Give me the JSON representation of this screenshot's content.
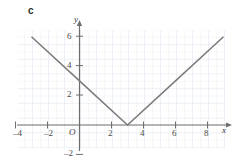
{
  "part_label": "c",
  "colors": {
    "grid": "#dfe6ef",
    "axis": "#6e6e6e",
    "curve": "#7a7a7a",
    "text": "#3a3a3a",
    "background": "#ffffff"
  },
  "axes": {
    "x_axis_label": "x",
    "y_axis_label": "y",
    "origin_label": "O",
    "x_ticks": [
      {
        "value": -4,
        "label": "–4"
      },
      {
        "value": -2,
        "label": "–2"
      },
      {
        "value": 2,
        "label": "2"
      },
      {
        "value": 4,
        "label": "4"
      },
      {
        "value": 6,
        "label": "6"
      },
      {
        "value": 8,
        "label": "8"
      }
    ],
    "y_ticks": [
      {
        "value": 6,
        "label": "6"
      },
      {
        "value": 4,
        "label": "4"
      },
      {
        "value": 2,
        "label": "2"
      },
      {
        "value": -2,
        "label": "–2"
      }
    ]
  },
  "chart_data": {
    "type": "line",
    "title": "",
    "subtitle": "",
    "xlabel": "x",
    "ylabel": "y",
    "xlim": [
      -4.2,
      9.5
    ],
    "ylim": [
      -2.5,
      7
    ],
    "grid": true,
    "legend": null,
    "x_ticks": [
      -4,
      -2,
      0,
      2,
      4,
      6,
      8
    ],
    "y_ticks": [
      -2,
      0,
      2,
      4,
      6
    ],
    "equation": "y = |x - 3|",
    "vertex": [
      3,
      0
    ],
    "y_intercept": 3,
    "series": [
      {
        "name": "y = |x - 3|",
        "points": [
          [
            -3,
            6
          ],
          [
            0,
            3
          ],
          [
            3,
            0
          ],
          [
            6,
            3
          ],
          [
            9,
            6
          ]
        ]
      }
    ]
  }
}
